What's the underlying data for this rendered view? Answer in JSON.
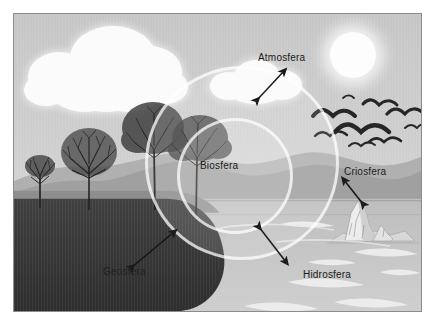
{
  "figure": {
    "border_color": "#8c8c8c",
    "background_color": "#c9c9c9"
  },
  "labels": {
    "atmosfera": "Atmosfera",
    "biosfera": "Biosfera",
    "geosfera": "Geosfera",
    "criosfera": "Criosfera",
    "hidrosfera": "Hidrosfera"
  },
  "icons": {
    "sun": "sun-icon",
    "clouds": "cloud-icon",
    "birds": "birds-flock-icon",
    "iceberg": "iceberg-icon",
    "trees": "bare-tree-icon",
    "waves": "water-waves-icon",
    "arrow": "double-headed-arrow-icon",
    "sphere_ring": "circle-ring-icon"
  },
  "colors": {
    "sky": "#cccccc",
    "hills": "#a3a3a3",
    "hills_far": "#b4b4b4",
    "ground": "#3a3a3a",
    "water": "#c0c0c0",
    "white": "#fbfbfb",
    "ink": "#1b1b1b",
    "ring_stroke": "#ffffff"
  },
  "scene": {
    "spheres": [
      {
        "name": "Atmosfera",
        "description": "sky, clouds and air layer"
      },
      {
        "name": "Biosfera",
        "description": "living beings, trees and birds, shown by the two overlapping circles"
      },
      {
        "name": "Geosfera",
        "description": "dark soil and rock beneath the surface"
      },
      {
        "name": "Criosfera",
        "description": "iceberg floating in the water"
      },
      {
        "name": "Hidrosfera",
        "description": "lake or sea water on the right"
      }
    ],
    "arrow_count": 5
  }
}
